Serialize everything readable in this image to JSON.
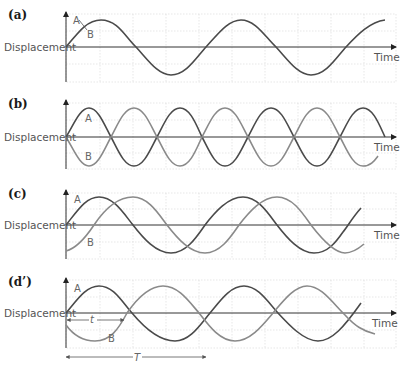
{
  "figure": {
    "panels": [
      {
        "id": "a",
        "label": "(a)",
        "y_axis_label": "Displacement",
        "x_axis_label": "Time",
        "curve_labels": {
          "A": "A",
          "B": "B"
        },
        "description": "A and B in phase (identical, overlapping)"
      },
      {
        "id": "b",
        "label": "(b)",
        "y_axis_label": "Displacement",
        "x_axis_label": "Time",
        "curve_labels": {
          "A": "A",
          "B": "B"
        },
        "description": "A and B in antiphase"
      },
      {
        "id": "c",
        "label": "(c)",
        "y_axis_label": "Displacement",
        "x_axis_label": "Time",
        "curve_labels": {
          "A": "A",
          "B": "B"
        },
        "description": "B lags A by a quarter period"
      },
      {
        "id": "d",
        "label": "(d’)",
        "y_axis_label": "Displacement",
        "x_axis_label": "Time",
        "curve_labels": {
          "A": "A",
          "B": "B"
        },
        "dimension_labels": {
          "t": "t",
          "T": "T"
        },
        "description": "Phase difference t over period T"
      }
    ],
    "colors": {
      "curve_a": "#4a4a4a",
      "curve_b": "#8a8a8a",
      "grid": "#d6d6d6",
      "axis": "#333333"
    }
  }
}
